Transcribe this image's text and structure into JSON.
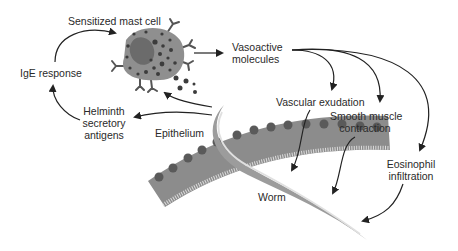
{
  "diagram": {
    "colors": {
      "cell_body": "#8f8f8f",
      "nucleus": "#6b6b6b",
      "granule": "#3c3c3c",
      "epithelium": "#8c8c8c",
      "epithelium_nucleus": "#5a5a5a",
      "worm_outer": "#9c9c9c",
      "worm_inner": "#d8d8d8",
      "arrow": "#222222",
      "text": "#2a2a2a"
    },
    "nodes": {
      "mast_cell": "Sensitized mast cell",
      "ige": "IgE response",
      "helminth_line1": "Helminth",
      "helminth_line2": "secretory",
      "helminth_line3": "antigens",
      "vasoactive_line1": "Vasoactive",
      "vasoactive_line2": "molecules",
      "vascular": "Vascular exudation",
      "smooth_line1": "Smooth muscle",
      "smooth_line2": "contraction",
      "eosinophil_line1": "Eosinophil",
      "eosinophil_line2": "infiltration",
      "epithelium": "Epithelium",
      "worm": "Worm"
    },
    "edges": [
      {
        "from": "IgE response",
        "to": "Sensitized mast cell"
      },
      {
        "from": "Helminth secretory antigens",
        "to": "IgE response"
      },
      {
        "from": "Worm",
        "to": "Helminth secretory antigens"
      },
      {
        "from": "Worm",
        "to": "Sensitized mast cell"
      },
      {
        "from": "Sensitized mast cell",
        "to": "Vasoactive molecules"
      },
      {
        "from": "Vasoactive molecules",
        "to": "Vascular exudation"
      },
      {
        "from": "Vasoactive molecules",
        "to": "Smooth muscle contraction"
      },
      {
        "from": "Vasoactive molecules",
        "to": "Eosinophil infiltration"
      },
      {
        "from": "Vascular exudation",
        "to": "Worm"
      },
      {
        "from": "Smooth muscle contraction",
        "to": "Worm"
      },
      {
        "from": "Eosinophil infiltration",
        "to": "Worm"
      }
    ]
  }
}
